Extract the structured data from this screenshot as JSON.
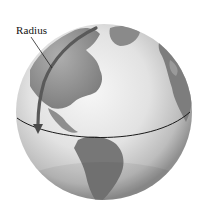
{
  "figure": {
    "annotations": [
      {
        "label": "Radius",
        "target": "radius-arrow"
      }
    ],
    "features": [
      "equator-line",
      "radius-arrow",
      "continents"
    ],
    "colors": {
      "ocean_light": "#f2f2f2",
      "ocean_shade": "#9a9a9a",
      "land": "#8c8c8c",
      "land_dark": "#6e6e6e",
      "arrow": "#555555",
      "equator": "#1a1a1a",
      "text": "#111111"
    }
  }
}
